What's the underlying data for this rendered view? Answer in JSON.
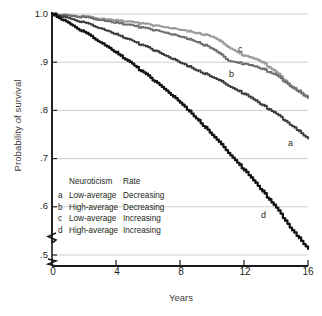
{
  "axes": {
    "ylabel": "Probability of survival",
    "xlabel": "Years",
    "yticks": [
      "1.0",
      ".9",
      ".8",
      ".7",
      ".6",
      ".5"
    ],
    "xticks": [
      "0",
      "4",
      "8",
      "12",
      "16"
    ]
  },
  "legend": {
    "header": {
      "key": "",
      "neuroticism": "Neuroticism",
      "rate": "Rate"
    },
    "rows": [
      {
        "key": "a",
        "neuroticism": "Low-average",
        "rate": "Decreasing"
      },
      {
        "key": "b",
        "neuroticism": "High-average",
        "rate": "Decreasing"
      },
      {
        "key": "c",
        "neuroticism": "Low-average",
        "rate": "Increasing"
      },
      {
        "key": "d",
        "neuroticism": "High-average",
        "rate": "Increasing"
      }
    ]
  },
  "curve_labels": {
    "a": "a",
    "b": "b",
    "c": "c",
    "d": "d"
  },
  "colors": {
    "curve_a": "#3b3b3b",
    "curve_b": "#6e6e6e",
    "curve_c": "#9a9a9a",
    "curve_d": "#111111",
    "gridline": "#c9c9c9",
    "axis": "#1a1a1a"
  },
  "chart_data": {
    "type": "line",
    "title": "",
    "xlabel": "Years",
    "ylabel": "Probability of survival",
    "xlim": [
      0,
      16
    ],
    "ylim": [
      0.5,
      1.0
    ],
    "xticks": [
      0,
      4,
      8,
      12,
      16
    ],
    "yticks": [
      0.5,
      0.6,
      0.7,
      0.8,
      0.9,
      1.0
    ],
    "grid": "horizontal",
    "legend_position": "inside-lower-left",
    "legend_columns": [
      "Neuroticism",
      "Rate"
    ],
    "x": [
      0,
      1,
      2,
      3,
      4,
      5,
      6,
      7,
      8,
      9,
      10,
      11,
      12,
      13,
      14,
      15,
      16
    ],
    "series": [
      {
        "name": "a",
        "label": "a",
        "neuroticism": "Low-average",
        "rate": "Decreasing",
        "color": "#3b3b3b",
        "values": [
          1.0,
          0.992,
          0.982,
          0.971,
          0.958,
          0.944,
          0.93,
          0.915,
          0.899,
          0.884,
          0.869,
          0.852,
          0.834,
          0.814,
          0.793,
          0.768,
          0.742
        ]
      },
      {
        "name": "b",
        "label": "b",
        "neuroticism": "High-average",
        "rate": "Decreasing",
        "color": "#6e6e6e",
        "values": [
          1.0,
          0.997,
          0.993,
          0.988,
          0.982,
          0.976,
          0.969,
          0.962,
          0.953,
          0.943,
          0.928,
          0.904,
          0.896,
          0.888,
          0.873,
          0.848,
          0.826
        ]
      },
      {
        "name": "c",
        "label": "c",
        "neuroticism": "Low-average",
        "rate": "Increasing",
        "color": "#9a9a9a",
        "values": [
          1.0,
          0.998,
          0.995,
          0.991,
          0.987,
          0.983,
          0.978,
          0.973,
          0.967,
          0.961,
          0.953,
          0.932,
          0.913,
          0.903,
          0.879,
          0.849,
          0.829
        ]
      },
      {
        "name": "d",
        "label": "d",
        "neuroticism": "High-average",
        "rate": "Increasing",
        "color": "#111111",
        "values": [
          1.0,
          0.982,
          0.962,
          0.942,
          0.92,
          0.896,
          0.871,
          0.845,
          0.816,
          0.784,
          0.749,
          0.713,
          0.676,
          0.638,
          0.598,
          0.552,
          0.513
        ]
      }
    ]
  }
}
